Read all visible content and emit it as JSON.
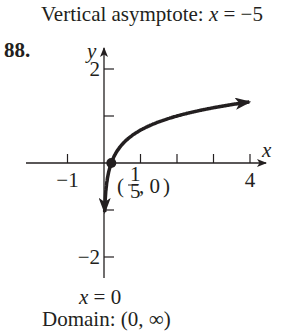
{
  "header": {
    "asymptote_label": "Vertical asymptote: ",
    "asymptote_var": "x",
    "asymptote_eq": " = −5"
  },
  "problem_number": "88.",
  "footer": {
    "asymptote_var": "x",
    "asymptote_eq": " = 0",
    "domain": "Domain: (0, ∞)"
  },
  "chart_data": {
    "type": "line",
    "title": "",
    "function": "y = log(5x)",
    "xlabel": "x",
    "ylabel": "y",
    "xlim": [
      -1.3,
      4.5
    ],
    "ylim": [
      -2.4,
      2.5
    ],
    "x_ticks": [
      -1,
      1,
      2,
      3,
      4
    ],
    "x_tick_labels": {
      "-1": "−1",
      "4": "4"
    },
    "y_ticks": [
      -2,
      -1,
      1,
      2
    ],
    "y_tick_labels": {
      "-2": "−2",
      "2": "2"
    },
    "grid": false,
    "series": [
      {
        "name": "y = log(5x)",
        "x": [
          0.017,
          0.05,
          0.1,
          0.2,
          0.4,
          0.7,
          1,
          1.5,
          2,
          2.5,
          3,
          3.5,
          4
        ],
        "values": [
          -1.07,
          -0.6,
          -0.3,
          0,
          0.3,
          0.54,
          0.7,
          0.88,
          1.0,
          1.1,
          1.18,
          1.24,
          1.3
        ]
      }
    ],
    "annotations": [
      {
        "point": [
          0.2,
          0
        ],
        "label_num": "1",
        "label_den": "5",
        "label_rest": ", 0)"
      }
    ],
    "vertical_asymptote": {
      "x": 0,
      "label": "x = 0"
    }
  }
}
